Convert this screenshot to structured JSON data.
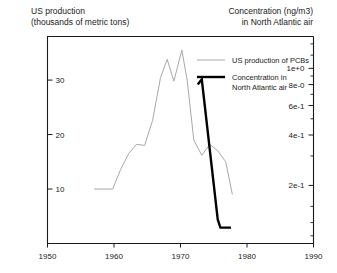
{
  "figure": {
    "width": 337,
    "height": 273,
    "background": "#ffffff"
  },
  "left_axis_title": "US production\n(thousands of metric tons)",
  "right_axis_title": "Concentration (ng/m3)\nin North Atlantic air",
  "colors": {
    "series_production": "#a8a8a8",
    "series_concentration": "#000000",
    "axis": "#1a1a1a",
    "text": "#1a1a1a"
  },
  "chart_data": {
    "type": "line",
    "title": "",
    "subtitle": "",
    "xlabel": "",
    "ylabel": "US production (thousands of metric tons)",
    "y2label": "Concentration (ng/m3) in North Atlantic air",
    "xlim": [
      1950,
      1990
    ],
    "xticks": [
      1950,
      1960,
      1970,
      1980,
      1990
    ],
    "xtick_labels": [
      "1950",
      "1960",
      "1970",
      "1980",
      "1990"
    ],
    "ylim": [
      0,
      38
    ],
    "yticks": [
      10,
      20,
      30
    ],
    "ytick_labels": [
      "10",
      "20",
      "30"
    ],
    "y2_scale": "log",
    "y2ticks": [
      0.2,
      0.4,
      0.6,
      0.8,
      1.0
    ],
    "y2tick_labels": [
      "2e-1",
      "4e-1",
      "6e-1",
      "8e-0",
      "1e+0"
    ],
    "grid": false,
    "legend_position": "upper-right-inside",
    "series": [
      {
        "name": "US production of PCBs",
        "axis": "left",
        "color": "#a8a8a8",
        "line_width": 1,
        "x": [
          1957.0,
          1958.4,
          1959.8,
          1961.0,
          1962.2,
          1963.4,
          1964.6,
          1965.8,
          1967.0,
          1968.0,
          1969.0,
          1970.2,
          1971.0,
          1972.0,
          1973.2,
          1974.4,
          1975.6,
          1976.8,
          1977.8
        ],
        "values": [
          10.0,
          10.0,
          10.0,
          13.6,
          16.5,
          18.2,
          18.0,
          22.6,
          30.5,
          33.8,
          29.8,
          35.5,
          30.0,
          19.0,
          16.2,
          18.2,
          17.0,
          15.0,
          9.0
        ]
      },
      {
        "name": "Concentration in North Atlantic air",
        "axis": "right",
        "color": "#000000",
        "line_width": 2.4,
        "x": [
          1972.6,
          1973.2,
          1975.6,
          1976.0,
          1977.6
        ],
        "values": [
          0.8,
          0.86,
          0.125,
          0.112,
          0.112
        ]
      }
    ],
    "legend": [
      {
        "label": "US production of PCBs",
        "color": "#a8a8a8",
        "line_width": 1
      },
      {
        "label": "Concentration in\nNorth Atlantic air",
        "color": "#000000",
        "line_width": 2.4
      }
    ]
  }
}
